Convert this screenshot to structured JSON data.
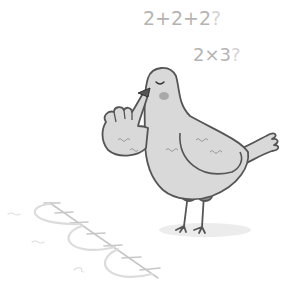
{
  "illustration": {
    "subject": "pigeon thinking about multiplication",
    "equations": [
      {
        "text": "2+2+2",
        "mark": "?"
      },
      {
        "text": "2×3",
        "mark": "?"
      }
    ],
    "number_line": {
      "ticks": 8,
      "jumps": 3,
      "jump_labels": [
        "~~~",
        "~~",
        "~"
      ]
    },
    "colors": {
      "outline": "#555555",
      "body": "#d9d9d9",
      "cheek": "#a9a9a9",
      "legs": "#8a8a8a",
      "equation_text": "#b4b4b4",
      "number_line": "#c8c8c8",
      "shadow": "#ececec"
    }
  }
}
